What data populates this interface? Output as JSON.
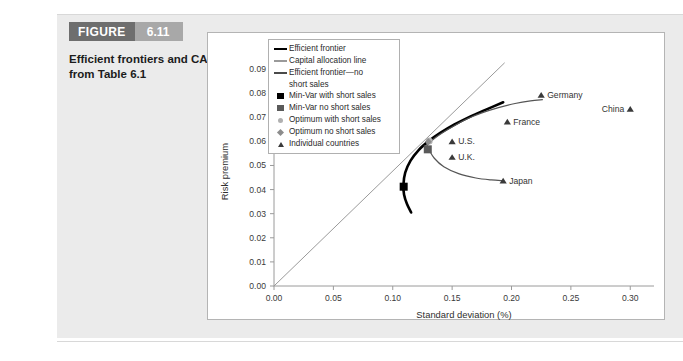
{
  "figure": {
    "word": "FIGURE",
    "number": "6.11",
    "caption": "Efficient frontiers and CAL from Table 6.1"
  },
  "legend": {
    "items": [
      {
        "key": "line-thick",
        "label": "Efficient frontier"
      },
      {
        "key": "line-cal",
        "label": "Capital allocation line"
      },
      {
        "key": "line-nss",
        "label": "Efficient frontier—no\nshort sales"
      },
      {
        "key": "square-black",
        "label": "Min-Var with short sales"
      },
      {
        "key": "square-grey",
        "label": "Min-Var no short sales"
      },
      {
        "key": "circle-grey",
        "label": "Optimum with short sales"
      },
      {
        "key": "diamond-grey",
        "label": "Optimum no short sales"
      },
      {
        "key": "triangle",
        "label": "Individual countries"
      }
    ]
  },
  "chart_data": {
    "type": "line",
    "title": "Efficient frontiers and CAL from Table 6.1",
    "xlabel": "Standard deviation (%)",
    "ylabel": "Risk premium",
    "xlim": [
      0.0,
      0.32
    ],
    "ylim": [
      0.0,
      0.095
    ],
    "xticks": [
      "0.00",
      "0.05",
      "0.10",
      "0.15",
      "0.20",
      "0.25",
      "0.30"
    ],
    "xtick_values": [
      0.0,
      0.05,
      0.1,
      0.15,
      0.2,
      0.25,
      0.3
    ],
    "yticks": [
      "0.00",
      "0.01",
      "0.02",
      "0.03",
      "0.04",
      "0.05",
      "0.06",
      "0.07",
      "0.08",
      "0.09"
    ],
    "ytick_values": [
      0.0,
      0.01,
      0.02,
      0.03,
      0.04,
      0.05,
      0.06,
      0.07,
      0.08,
      0.09
    ],
    "grid": false,
    "legend_position": "upper left",
    "series": [
      {
        "name": "Efficient frontier",
        "style": "thick-black",
        "color": "#000000",
        "points": [
          [
            0.1155,
            0.0305
          ],
          [
            0.112,
            0.034
          ],
          [
            0.1095,
            0.038
          ],
          [
            0.109,
            0.042
          ],
          [
            0.1105,
            0.047
          ],
          [
            0.115,
            0.052
          ],
          [
            0.122,
            0.0565
          ],
          [
            0.13,
            0.06
          ],
          [
            0.14,
            0.0635
          ],
          [
            0.152,
            0.067
          ],
          [
            0.166,
            0.0705
          ],
          [
            0.18,
            0.0735
          ],
          [
            0.193,
            0.0762
          ]
        ]
      },
      {
        "name": "Capital allocation line",
        "style": "thin-grey",
        "color": "#9a9a9a",
        "points": [
          [
            0.0,
            0.0
          ],
          [
            0.194,
            0.0925
          ]
        ]
      },
      {
        "name": "Efficient frontier—no short sales",
        "style": "thin-dark",
        "color": "#555555",
        "points": [
          [
            0.127,
            0.057
          ],
          [
            0.132,
            0.06
          ],
          [
            0.14,
            0.063
          ],
          [
            0.15,
            0.066
          ],
          [
            0.162,
            0.0692
          ],
          [
            0.175,
            0.0718
          ],
          [
            0.189,
            0.074
          ],
          [
            0.203,
            0.0757
          ],
          [
            0.216,
            0.0768
          ],
          [
            0.226,
            0.0773
          ]
        ]
      },
      {
        "name": "Lower branch no short sales",
        "style": "thin-dark",
        "color": "#555555",
        "points": [
          [
            0.13,
            0.057
          ],
          [
            0.135,
            0.053
          ],
          [
            0.143,
            0.0495
          ],
          [
            0.156,
            0.0465
          ],
          [
            0.17,
            0.0448
          ],
          [
            0.183,
            0.044
          ],
          [
            0.193,
            0.0437
          ]
        ]
      }
    ],
    "markers": [
      {
        "name": "Min-Var with short sales",
        "shape": "square",
        "color": "#000000",
        "size": 8,
        "x": 0.1092,
        "y": 0.0412
      },
      {
        "name": "Min-Var no short sales",
        "shape": "square",
        "color": "#5a5a5a",
        "size": 8,
        "x": 0.1295,
        "y": 0.0567
      },
      {
        "name": "Optimum with short sales",
        "shape": "circle",
        "color": "#b5b5b5",
        "size": 7,
        "x": 0.1307,
        "y": 0.0602
      },
      {
        "name": "Optimum no short sales",
        "shape": "diamond",
        "color": "#8c8c8c",
        "size": 7,
        "x": 0.13,
        "y": 0.0598
      }
    ],
    "countries": [
      {
        "label": "Germany",
        "x": 0.225,
        "y": 0.0793,
        "label_side": "right"
      },
      {
        "label": "China",
        "x": 0.3,
        "y": 0.0735,
        "label_side": "left"
      },
      {
        "label": "France",
        "x": 0.1965,
        "y": 0.0682,
        "label_side": "right"
      },
      {
        "label": "U.S.",
        "x": 0.15,
        "y": 0.06,
        "label_side": "right"
      },
      {
        "label": "U.K.",
        "x": 0.15,
        "y": 0.0535,
        "label_side": "right"
      },
      {
        "label": "Japan",
        "x": 0.193,
        "y": 0.0437,
        "label_side": "right"
      }
    ]
  }
}
